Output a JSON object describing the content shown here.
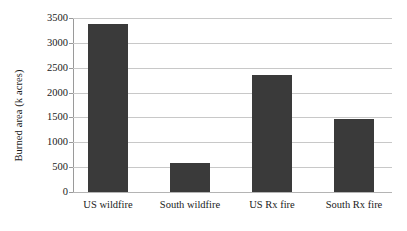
{
  "chart_data": {
    "type": "bar",
    "title": "",
    "xlabel": "",
    "ylabel": "Burned area (k acres)",
    "categories": [
      "US wildfire",
      "South wildfire",
      "US Rx fire",
      "South Rx fire"
    ],
    "values": [
      3380,
      580,
      2350,
      1470
    ],
    "ylim": [
      0,
      3500
    ],
    "ytick_labels": [
      "0",
      "500",
      "1000",
      "1500",
      "2000",
      "2500",
      "3000",
      "3500"
    ],
    "ytick_values": [
      0,
      500,
      1000,
      1500,
      2000,
      2500,
      3000,
      3500
    ],
    "grid": true,
    "legend": false,
    "bar_color": "#3a3a3a",
    "gridline_color": "#c8c8c8",
    "axis_color": "#9a9a9a",
    "background_color": "#ffffff"
  }
}
